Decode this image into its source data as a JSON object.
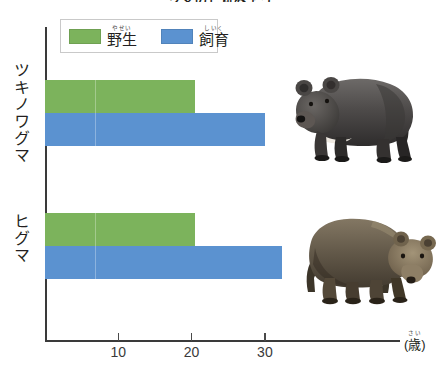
{
  "title": "クマのじゅみょう",
  "legend": {
    "box_name": "chart-legend",
    "items": [
      {
        "id": "wild",
        "ruby": "やせい",
        "label": "野生",
        "color": "#7cb35c"
      },
      {
        "id": "captive",
        "ruby": "しいく",
        "label": "飼育",
        "color": "#5b92d0"
      }
    ]
  },
  "axis": {
    "unit_ruby": "さい",
    "unit_label": "歳",
    "unit_display": "(歳)",
    "ticks": [
      {
        "value": 10,
        "label": "10"
      },
      {
        "value": 20,
        "label": "20"
      },
      {
        "value": 30,
        "label": "30"
      }
    ]
  },
  "categories": [
    {
      "label": "ツキノワグマ",
      "art": "asian-black-bear"
    },
    {
      "label": "ヒグマ",
      "art": "brown-bear"
    }
  ],
  "chart_data": {
    "type": "bar",
    "orientation": "horizontal",
    "title": "クマのじゅみょう",
    "xlabel": "(歳)",
    "ylabel": "",
    "xlim": [
      0,
      38
    ],
    "categories": [
      "ツキノワグマ",
      "ヒグマ"
    ],
    "series": [
      {
        "name": "野生",
        "color": "#7cb35c",
        "values": [
          20.5,
          20.5
        ]
      },
      {
        "name": "飼育",
        "color": "#5b92d0",
        "values": [
          30.0,
          32.3
        ]
      }
    ],
    "tick_values": [
      10,
      20,
      30
    ],
    "tick_labels": [
      "10",
      "20",
      "30"
    ],
    "grid": false,
    "legend_position": "top-left",
    "units": "years"
  }
}
